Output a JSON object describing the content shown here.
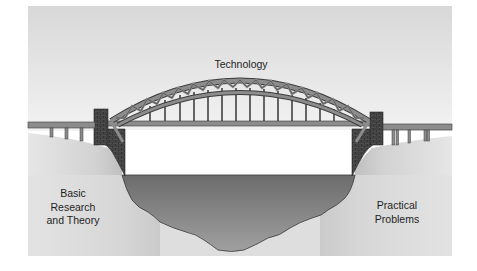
{
  "diagram": {
    "type": "metaphor-illustration",
    "labels": {
      "top": "Technology",
      "left": [
        "Basic",
        "Research",
        "and Theory"
      ],
      "right": [
        "Practical",
        "Problems"
      ]
    },
    "colors": {
      "sky_top": "#d9d9d9",
      "sky_bottom": "#f0f0f0",
      "ground": "#d6d6d6",
      "water_top": "#6f6f6f",
      "water_bottom": "#9a9a9a",
      "steel": "#8c8c8c",
      "steel_outline": "#3a3a3a",
      "brick": "#4a4a4a",
      "text": "#1e1e1e"
    }
  }
}
